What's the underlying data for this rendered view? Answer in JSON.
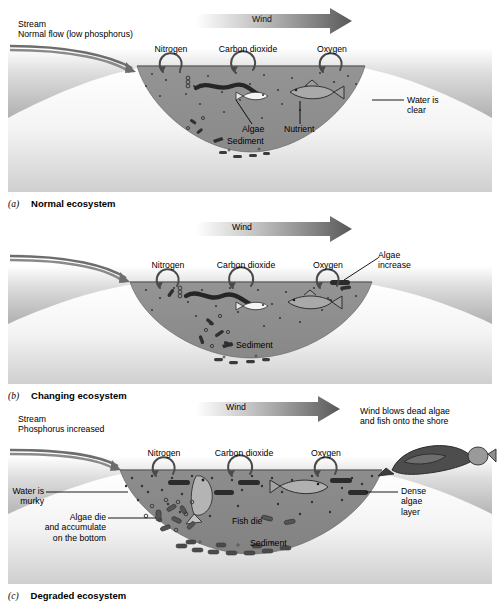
{
  "figure": {
    "panel_count": 3
  },
  "shared": {
    "wind_label": "Wind",
    "gases": [
      "Nitrogen",
      "Carbon dioxide",
      "Oxygen"
    ],
    "sediment_label": "Sediment",
    "colors": {
      "water": "#8f8f8f",
      "water_murky": "#8a8a8a",
      "bank_light": "#d8d8d8",
      "bank_dark": "#6f6f6f",
      "basin": "#f2f2f2",
      "organism": "#2e2e2e",
      "arrow_dark": "#4a4a4a",
      "ink": "#000000"
    }
  },
  "panels": [
    {
      "id": "a",
      "caption_letter": "(a)",
      "caption_text": "Normal ecosystem",
      "wind": "Wind",
      "gases": [
        "Nitrogen",
        "Carbon dioxide",
        "Oxygen"
      ],
      "stream": {
        "line1": "Stream",
        "line2": "Normal flow (low phosphorus)"
      },
      "labels": [
        {
          "name": "water-clear",
          "text": "Water is\nclear"
        },
        {
          "name": "algae",
          "text": "Algae"
        },
        {
          "name": "nutrient",
          "text": "Nutrient"
        },
        {
          "name": "sediment",
          "text": "Sediment"
        }
      ]
    },
    {
      "id": "b",
      "caption_letter": "(b)",
      "caption_text": "Changing ecosystem",
      "wind": "Wind",
      "gases": [
        "Nitrogen",
        "Carbon dioxide",
        "Oxygen"
      ],
      "stream": null,
      "labels": [
        {
          "name": "algae-increase",
          "text": "Algae\nincrease"
        },
        {
          "name": "sediment",
          "text": "Sediment"
        }
      ]
    },
    {
      "id": "c",
      "caption_letter": "(c)",
      "caption_text": "Degraded ecosystem",
      "wind": "Wind",
      "gases": [
        "Nitrogen",
        "Carbon dioxide",
        "Oxygen"
      ],
      "stream": {
        "line1": "Stream",
        "line2": "Phosphorus increased"
      },
      "labels": [
        {
          "name": "wind-blows-algae",
          "text": "Wind blows dead algae\nand fish onto the shore"
        },
        {
          "name": "water-murky",
          "text": "Water is\nmurky"
        },
        {
          "name": "algae-die",
          "text": "Algae die\nand accumulate\non the bottom"
        },
        {
          "name": "fish-die",
          "text": "Fish die"
        },
        {
          "name": "dense-algae-layer",
          "text": "Dense\nalgae\nlayer"
        },
        {
          "name": "sediment",
          "text": "Sediment"
        }
      ]
    }
  ]
}
